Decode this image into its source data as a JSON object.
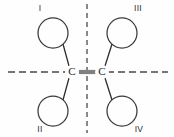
{
  "diagram": {
    "type": "chemical-structure",
    "background_color": "#fefefe",
    "line_color": "#2e2e2e",
    "axis_color": "#4a4a4a",
    "atoms": [
      {
        "id": "carbon-left",
        "label": "C",
        "x": 72,
        "y": 72
      },
      {
        "id": "carbon-right",
        "label": "C",
        "x": 102,
        "y": 72
      }
    ],
    "bond": {
      "label": "C=C double bond",
      "order": 2,
      "x1": 78,
      "x2": 96,
      "y": 72,
      "color": "#808080"
    },
    "substituents": [
      {
        "id": "substituent-i",
        "roman": "I",
        "cx": 53,
        "cy": 33,
        "r": 15,
        "label_x": 40,
        "label_y": 9,
        "bond_x1": 63,
        "bond_y1": 44,
        "bond_x2": 69,
        "bond_y2": 66
      },
      {
        "id": "substituent-ii",
        "roman": "II",
        "cx": 53,
        "cy": 111,
        "r": 15,
        "label_x": 40,
        "label_y": 130,
        "bond_x1": 63,
        "bond_y1": 100,
        "bond_x2": 69,
        "bond_y2": 78
      },
      {
        "id": "substituent-iii",
        "roman": "III",
        "cx": 122,
        "cy": 33,
        "r": 15,
        "label_x": 138,
        "label_y": 9,
        "bond_x1": 112,
        "bond_y1": 44,
        "bond_x2": 105,
        "bond_y2": 66
      },
      {
        "id": "substituent-iv",
        "roman": "IV",
        "cx": 122,
        "cy": 111,
        "r": 15,
        "label_x": 139,
        "label_y": 130,
        "bond_x1": 112,
        "bond_y1": 100,
        "bond_x2": 105,
        "bond_y2": 78
      }
    ],
    "axes": [
      {
        "id": "axis-horizontal",
        "orientation": "horizontal",
        "x1": 8,
        "y1": 72,
        "x2": 168,
        "y2": 72
      },
      {
        "id": "axis-vertical",
        "orientation": "vertical",
        "x1": 87,
        "y1": 4,
        "x2": 87,
        "y2": 133
      }
    ]
  }
}
